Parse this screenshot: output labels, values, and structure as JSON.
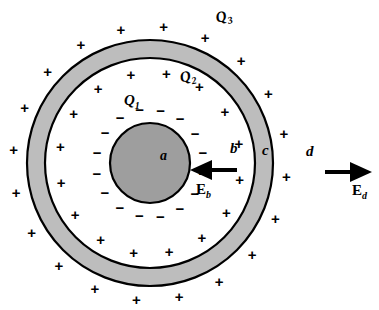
{
  "figure": {
    "background": "#ffffff",
    "stroke": "#000000"
  },
  "geometry": {
    "center_x": 150,
    "center_y": 163,
    "inner_sphere_radius": 40,
    "shell_inner_radius": 105,
    "shell_outer_radius": 123,
    "inner_sphere_fill": "#9e9e9e",
    "shell_fill": "#bdbdbd"
  },
  "labels": {
    "charge_inner": "Q",
    "charge_inner_sub": "1",
    "charge_mid": "Q",
    "charge_mid_sub": "2",
    "charge_outer": "Q",
    "charge_outer_sub": "3",
    "radius_a": "a",
    "radius_b": "b",
    "radius_c": "c",
    "radius_d": "d",
    "field_b": "E",
    "field_b_sub": "b",
    "field_d": "E",
    "field_d_sub": "d"
  },
  "signs": {
    "negative_glyph": "−",
    "positive_glyph": "+",
    "inner_negative_count": 16,
    "mid_positive_count": 16,
    "outer_positive_count": 20
  },
  "arrows": [
    {
      "name": "field-arrow-b",
      "direction": "left",
      "x1": 237,
      "y1": 170,
      "x2": 196,
      "y2": 170
    },
    {
      "name": "field-arrow-d",
      "direction": "right",
      "x1": 325,
      "y1": 172,
      "x2": 368,
      "y2": 172
    }
  ],
  "chart_data": {
    "type": "diagram",
    "regions": [
      {
        "label": "Q1",
        "sign": "negative",
        "location": "inner sphere surface",
        "radius_symbol": "a"
      },
      {
        "label": "Q2",
        "sign": "positive",
        "location": "shell inner surface",
        "radius_symbol": "b"
      },
      {
        "label": "Q3",
        "sign": "positive",
        "location": "shell outer surface",
        "radius_symbol": "c"
      }
    ],
    "field_points": [
      {
        "label": "E_b",
        "direction": "inward (toward center)",
        "at": "b"
      },
      {
        "label": "E_d",
        "direction": "outward (away from center)",
        "at": "d"
      }
    ]
  }
}
